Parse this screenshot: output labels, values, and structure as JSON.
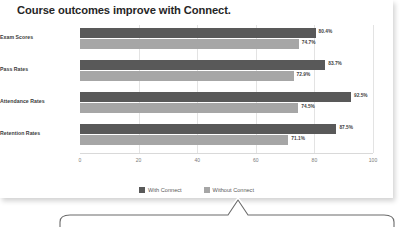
{
  "chart_data": {
    "type": "bar",
    "orientation": "horizontal",
    "title": "Course outcomes improve with Connect.",
    "categories": [
      "Exam Scores",
      "Pass Rates",
      "Attendance Rates",
      "Retention Rates"
    ],
    "series": [
      {
        "name": "With Connect",
        "color": "#595959",
        "values": [
          80.4,
          83.7,
          92.5,
          87.5
        ],
        "labels": [
          "80.4%",
          "83.7%",
          "92.5%",
          "87.5%"
        ]
      },
      {
        "name": "Without Connect",
        "color": "#a6a6a6",
        "values": [
          74.7,
          72.9,
          74.5,
          71.1
        ],
        "labels": [
          "74.7%",
          "72.9%",
          "74.5%",
          "71.1%"
        ]
      }
    ],
    "xlabel": "",
    "ylabel": "",
    "xlim": [
      0,
      100
    ],
    "xticks": [
      0,
      20,
      40,
      60,
      80,
      100
    ],
    "xtick_labels": [
      "0",
      "20",
      "40",
      "60",
      "80",
      "100"
    ],
    "grid": true,
    "grid_axis": "x",
    "legend_position": "bottom",
    "data_labels": true
  },
  "legend": {
    "items": [
      {
        "label": "With Connect",
        "color": "#595959"
      },
      {
        "label": "Without Connect",
        "color": "#a6a6a6"
      }
    ]
  },
  "callout": {
    "shape": "rounded-rectangle-with-up-pointer",
    "text": ""
  },
  "colors": {
    "primary_series": "#595959",
    "secondary_series": "#a6a6a6",
    "title_text": "#262626",
    "category_text": "#3a3a3a",
    "tick_text": "#7a7a7a",
    "gridline": "#e3e3e3",
    "card_background": "#ffffff",
    "callout_stroke": "#6b6b6b"
  }
}
